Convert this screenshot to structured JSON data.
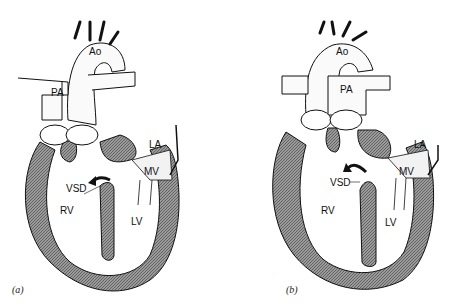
{
  "figure": {
    "panels": [
      {
        "id": "a",
        "caption": "(a)",
        "labels": {
          "aorta": "Ao",
          "pulmonary_artery": "PA",
          "left_atrium": "LA",
          "mitral_valve": "MV",
          "ventricular_septal_defect": "VSD",
          "right_ventricle": "RV",
          "left_ventricle": "LV"
        }
      },
      {
        "id": "b",
        "caption": "(b)",
        "labels": {
          "aorta": "Ao",
          "pulmonary_artery": "PA",
          "left_atrium": "LA",
          "mitral_valve": "MV",
          "ventricular_septal_defect": "VSD",
          "right_ventricle": "RV",
          "left_ventricle": "LV"
        }
      }
    ],
    "colors": {
      "wall_fill": "#8a8a8a",
      "outline": "#111111",
      "background": "#ffffff"
    }
  }
}
